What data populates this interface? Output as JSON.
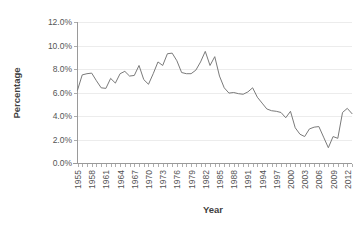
{
  "chart_data": {
    "type": "line",
    "title": "",
    "xlabel": "Year",
    "ylabel": "Percentage",
    "xlim": [
      1955,
      2013
    ],
    "ylim": [
      0,
      12
    ],
    "grid": true,
    "legend": "none",
    "y_tick_labels": [
      "0.0%",
      "2.0%",
      "4.0%",
      "6.0%",
      "8.0%",
      "10.0%",
      "12.0%"
    ],
    "y_tick_values": [
      0,
      2,
      4,
      6,
      8,
      10,
      12
    ],
    "x_tick_labels": [
      "1955",
      "1958",
      "1961",
      "1964",
      "1967",
      "1970",
      "1973",
      "1976",
      "1979",
      "1982",
      "1985",
      "1988",
      "1991",
      "1994",
      "1997",
      "2000",
      "2003",
      "2006",
      "2009",
      "2012"
    ],
    "x_tick_values": [
      1955,
      1958,
      1961,
      1964,
      1967,
      1970,
      1973,
      1976,
      1979,
      1982,
      1985,
      1988,
      1991,
      1994,
      1997,
      2000,
      2003,
      2006,
      2009,
      2012
    ],
    "x": [
      1955,
      1956,
      1957,
      1958,
      1959,
      1960,
      1961,
      1962,
      1963,
      1964,
      1965,
      1966,
      1967,
      1968,
      1969,
      1970,
      1971,
      1972,
      1973,
      1974,
      1975,
      1976,
      1977,
      1978,
      1979,
      1980,
      1981,
      1982,
      1983,
      1984,
      1985,
      1986,
      1987,
      1988,
      1989,
      1990,
      1991,
      1992,
      1993,
      1994,
      1995,
      1996,
      1997,
      1998,
      1999,
      2000,
      2001,
      2002,
      2003,
      2004,
      2005,
      2006,
      2007,
      2008,
      2009,
      2010,
      2011,
      2012,
      2013
    ],
    "values": [
      6.2,
      7.5,
      7.6,
      7.65,
      7.0,
      6.4,
      6.35,
      7.2,
      6.8,
      7.6,
      7.8,
      7.4,
      7.45,
      8.3,
      7.1,
      6.7,
      7.6,
      8.6,
      8.3,
      9.3,
      9.35,
      8.7,
      7.7,
      7.6,
      7.6,
      7.9,
      8.6,
      9.5,
      8.3,
      9.05,
      7.4,
      6.4,
      5.95,
      6.0,
      5.9,
      5.85,
      6.05,
      6.4,
      5.6,
      5.1,
      4.6,
      4.45,
      4.4,
      4.3,
      3.85,
      4.4,
      3.0,
      2.45,
      2.25,
      2.9,
      3.05,
      3.1,
      2.2,
      1.3,
      2.25,
      2.1,
      4.3,
      4.65,
      4.2
    ],
    "series_name": "Percentage"
  },
  "axis": {
    "y_title": "Percentage",
    "x_title": "Year"
  }
}
